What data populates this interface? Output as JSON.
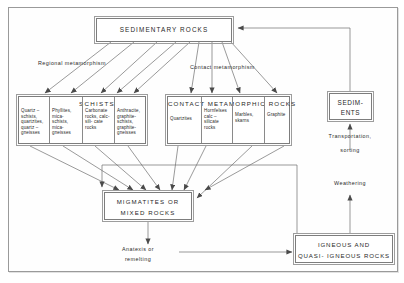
{
  "diagram": {
    "title_nodes": {
      "sedimentary": {
        "line1": "SEDIMENTARY      ROCKS"
      },
      "sediments": {
        "line1": "SEDIM-",
        "line2": "ENTS"
      },
      "migmatites": {
        "line1": "MIGMATITES    OR",
        "line2": "MIXED    ROCKS"
      },
      "igneous": {
        "line1": "IGNEOUS     AND",
        "line2": "QUASI- IGNEOUS   ROCKS"
      }
    },
    "groups": {
      "schists": {
        "header": "SCHISTS",
        "columns": [
          "Quartz – schists, quartzites, quartz – gneisses",
          "Phyllites, mica- schists, mica- gneisses",
          "Carbonate rocks, calc-sili- cate rocks",
          "Anthracite, graphite- schists, graphite- gneisses"
        ]
      },
      "contact": {
        "header": "CONTACT     METAMORPHIC     ROCKS",
        "columns": [
          "Quartzites",
          "Hornfelses calc – silicate rocks",
          "Marbles, skarns",
          "Graphite"
        ]
      }
    },
    "annotations": {
      "regional": "Regional   metamorphism",
      "contact": "Contact    metamorphism",
      "transportation": "Transportation,",
      "sorting": "sorting",
      "weathering": "Weathering",
      "anatexis1": "Anatexis   or",
      "anatexis2": "remelting"
    },
    "colors": {
      "line": "#6f6f6f",
      "box_border": "#7d7d7d",
      "text": "#1f1f1f",
      "background": "#ffffff"
    }
  }
}
